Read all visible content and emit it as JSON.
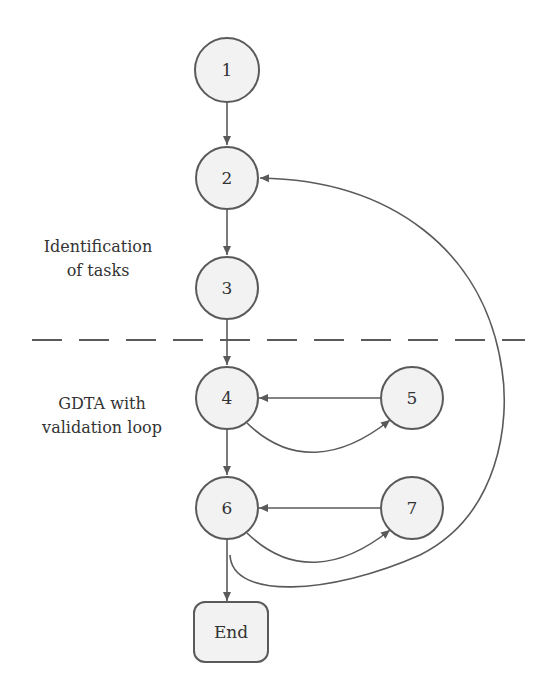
{
  "diagram": {
    "type": "flowchart",
    "colors": {
      "stroke": "#5a5a5a",
      "node_fill": "#f2f2f2",
      "text": "#333333",
      "background": "#ffffff"
    },
    "sections": [
      {
        "id": "identification",
        "line1": "Identification",
        "line2": "of tasks"
      },
      {
        "id": "gdta",
        "line1": "GDTA with",
        "line2": "validation loop"
      }
    ],
    "nodes": [
      {
        "id": "1",
        "label": "1",
        "shape": "circle"
      },
      {
        "id": "2",
        "label": "2",
        "shape": "circle"
      },
      {
        "id": "3",
        "label": "3",
        "shape": "circle"
      },
      {
        "id": "4",
        "label": "4",
        "shape": "circle"
      },
      {
        "id": "5",
        "label": "5",
        "shape": "circle"
      },
      {
        "id": "6",
        "label": "6",
        "shape": "circle"
      },
      {
        "id": "7",
        "label": "7",
        "shape": "circle"
      },
      {
        "id": "end",
        "label": "End",
        "shape": "rounded-rect"
      }
    ],
    "edges": [
      {
        "from": "1",
        "to": "2"
      },
      {
        "from": "2",
        "to": "3"
      },
      {
        "from": "3",
        "to": "4"
      },
      {
        "from": "5",
        "to": "4"
      },
      {
        "from": "4",
        "to": "5",
        "curved": true
      },
      {
        "from": "4",
        "to": "6"
      },
      {
        "from": "7",
        "to": "6"
      },
      {
        "from": "6",
        "to": "7",
        "curved": true
      },
      {
        "from": "6",
        "to": "end"
      },
      {
        "from": "6",
        "to": "2",
        "curved": true,
        "note": "large return loop"
      }
    ]
  }
}
